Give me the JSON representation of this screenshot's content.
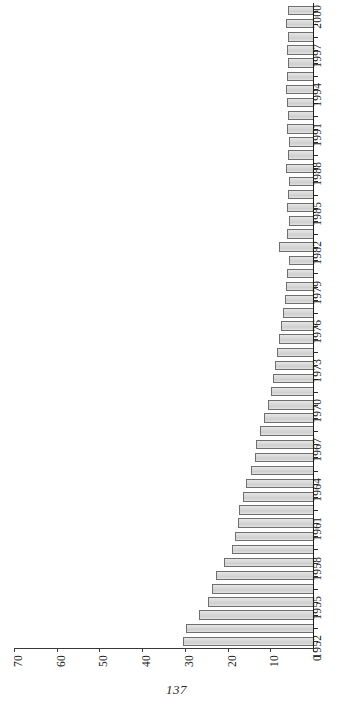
{
  "page": {
    "folio": "137"
  },
  "chart_data": {
    "type": "bar",
    "orientation": "horizontal-rotated",
    "title": "",
    "subtitle": "",
    "xlabel": "",
    "ylabel": "",
    "grid": false,
    "legend": null,
    "value_axis": {
      "min": 0,
      "max": 70,
      "reversed": true,
      "tick_step": 10,
      "tick_labels": [
        "70",
        "60",
        "50",
        "40",
        "30",
        "20",
        "10",
        "0"
      ],
      "tick_values": [
        70,
        60,
        50,
        40,
        30,
        20,
        10,
        0
      ]
    },
    "category_axis": {
      "label_step": 3,
      "first": "1952",
      "last": "2000",
      "labeled_ticks": [
        "1952",
        "1955",
        "1958",
        "1961",
        "1964",
        "1967",
        "1970",
        "1973",
        "1976",
        "1979",
        "1982",
        "1985",
        "1988",
        "1991",
        "1994",
        "1997",
        "2000"
      ]
    },
    "categories": [
      "1952",
      "1953",
      "1954",
      "1955",
      "1956",
      "1957",
      "1958",
      "1959",
      "1960",
      "1961",
      "1962",
      "1963",
      "1964",
      "1965",
      "1966",
      "1967",
      "1968",
      "1969",
      "1970",
      "1971",
      "1972",
      "1973",
      "1974",
      "1975",
      "1976",
      "1977",
      "1978",
      "1979",
      "1980",
      "1981",
      "1982",
      "1983",
      "1984",
      "1985",
      "1986",
      "1987",
      "1988",
      "1989",
      "1990",
      "1991",
      "1992",
      "1993",
      "1994",
      "1995",
      "1996",
      "1997",
      "1998",
      "1999",
      "2000"
    ],
    "values": [
      30.4,
      29.8,
      26.7,
      24.6,
      23.6,
      22.7,
      20.8,
      19.0,
      18.3,
      17.6,
      17.2,
      16.3,
      15.6,
      14.5,
      13.6,
      13.3,
      12.3,
      11.4,
      10.6,
      9.8,
      9.4,
      8.9,
      8.4,
      7.9,
      7.5,
      7.0,
      6.6,
      6.4,
      6.1,
      5.7,
      8.0,
      6.1,
      5.6,
      6.0,
      5.8,
      5.5,
      6.2,
      5.9,
      5.6,
      6.0,
      5.8,
      6.1,
      6.3,
      6.0,
      5.8,
      6.1,
      5.9,
      6.2,
      5.9
    ],
    "style": {
      "bar_fill": "#d9d9d9",
      "bar_border": "#6f6f6f",
      "axis_color": "#2a2a2a",
      "background": "#ffffff"
    }
  }
}
